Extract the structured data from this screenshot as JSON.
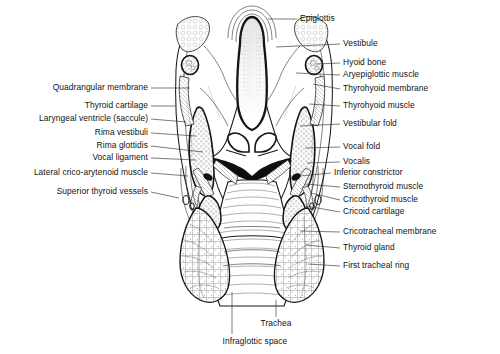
{
  "figure": {
    "type": "anatomical-illustration",
    "background_color": "#ffffff",
    "ink_color": "#1a1a1a"
  },
  "labels_left": [
    {
      "text": "Quadrangular membrane",
      "x": 148,
      "y": 88,
      "lead_to_x": 190,
      "lead_to_y": 88
    },
    {
      "text": "Thyroid cartilage",
      "x": 148,
      "y": 106,
      "lead_to_x": 176,
      "lead_to_y": 106
    },
    {
      "text": "Laryngeal ventricle (saccule)",
      "x": 148,
      "y": 119,
      "lead_to_x": 186,
      "lead_to_y": 122
    },
    {
      "text": "Rima vestibuli",
      "x": 148,
      "y": 133,
      "lead_to_x": 196,
      "lead_to_y": 136
    },
    {
      "text": "Rima glottidis",
      "x": 148,
      "y": 146,
      "lead_to_x": 203,
      "lead_to_y": 152
    },
    {
      "text": "Vocal ligament",
      "x": 148,
      "y": 158,
      "lead_to_x": 196,
      "lead_to_y": 160
    },
    {
      "text": "Lateral crico-arytenoid muscle",
      "x": 148,
      "y": 173,
      "lead_to_x": 188,
      "lead_to_y": 176
    },
    {
      "text": "Superior thyroid vessels",
      "x": 148,
      "y": 192,
      "lead_to_x": 179,
      "lead_to_y": 198
    }
  ],
  "labels_right": [
    {
      "text": "Epiglottis",
      "x": 300,
      "y": 19,
      "lead_to_x": 268,
      "lead_to_y": 19
    },
    {
      "text": "Vestibule",
      "x": 343,
      "y": 44,
      "lead_to_x": 276,
      "lead_to_y": 47
    },
    {
      "text": "Hyoid bone",
      "x": 343,
      "y": 63,
      "lead_to_x": 316,
      "lead_to_y": 64
    },
    {
      "text": "Aryepiglottic muscle",
      "x": 343,
      "y": 75,
      "lead_to_x": 296,
      "lead_to_y": 73
    },
    {
      "text": "Thyrohyoid membrane",
      "x": 343,
      "y": 89,
      "lead_to_x": 313,
      "lead_to_y": 84
    },
    {
      "text": "Thyrohyoid muscle",
      "x": 343,
      "y": 106,
      "lead_to_x": 309,
      "lead_to_y": 104
    },
    {
      "text": "Vestibular fold",
      "x": 343,
      "y": 124,
      "lead_to_x": 300,
      "lead_to_y": 126
    },
    {
      "text": "Vocal fold",
      "x": 343,
      "y": 147,
      "lead_to_x": 305,
      "lead_to_y": 148
    },
    {
      "text": "Vocalis",
      "x": 343,
      "y": 162,
      "lead_to_x": 307,
      "lead_to_y": 163
    },
    {
      "text": "Inferior constrictor",
      "x": 334,
      "y": 173,
      "lead_to_x": 300,
      "lead_to_y": 176
    },
    {
      "text": "Sternothyroid muscle",
      "x": 343,
      "y": 187,
      "lead_to_x": 305,
      "lead_to_y": 184
    },
    {
      "text": "Cricothyroid muscle",
      "x": 343,
      "y": 200,
      "lead_to_x": 311,
      "lead_to_y": 193
    },
    {
      "text": "Cricoid cartilage",
      "x": 343,
      "y": 212,
      "lead_to_x": 306,
      "lead_to_y": 206
    },
    {
      "text": "Cricotracheal membrane",
      "x": 343,
      "y": 232,
      "lead_to_x": 300,
      "lead_to_y": 231
    },
    {
      "text": "Thyroid gland",
      "x": 343,
      "y": 248,
      "lead_to_x": 306,
      "lead_to_y": 245
    },
    {
      "text": "First tracheal ring",
      "x": 343,
      "y": 266,
      "lead_to_x": 308,
      "lead_to_y": 264
    }
  ],
  "labels_bottom": [
    {
      "text": "Trachea",
      "x": 276,
      "y": 324,
      "lead_x": 276,
      "lead_y0": 300,
      "lead_y1": 317
    },
    {
      "text": "Infraglottic space",
      "x": 255,
      "y": 342,
      "lead_x": 232,
      "lead_y0": 292,
      "lead_y1": 334
    }
  ],
  "structures": [
    "epiglottis",
    "vestibule",
    "hyoid-bone",
    "thyrohyoid-membrane",
    "thyroid-cartilage",
    "quadrangular-membrane",
    "vestibular-fold",
    "laryngeal-ventricle",
    "vocal-fold",
    "vocal-ligament",
    "vocalis",
    "lateral-crico-arytenoid-muscle",
    "cricoid-cartilage",
    "cricothyroid-muscle",
    "sternothyroid-muscle",
    "inferior-constrictor",
    "thyroid-gland",
    "cricotracheal-membrane",
    "first-tracheal-ring",
    "trachea",
    "infraglottic-space",
    "superior-thyroid-vessels"
  ]
}
